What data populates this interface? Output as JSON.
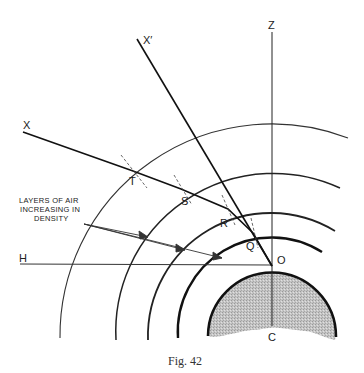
{
  "figure": {
    "caption": "Fig. 42",
    "annotation": {
      "lines": [
        "LAYERS OF AIR",
        "INCREASING IN",
        "DENSITY"
      ]
    },
    "labels": {
      "X": "X",
      "X_prime": "X′",
      "Z": "Z",
      "H": "H",
      "O": "O",
      "C": "C",
      "T": "T",
      "S": "S",
      "R": "R",
      "Q": "Q"
    },
    "colors": {
      "line": "#222222",
      "earth_fill": "#bdbdbd",
      "background": "#ffffff"
    }
  }
}
